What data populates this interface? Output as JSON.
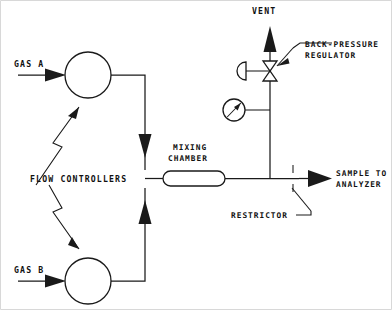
{
  "diagram": {
    "type": "process-flow-schematic",
    "ink_color": "#1a1a1a",
    "background_color": "#ffffff",
    "labels": {
      "gas_a": "GAS A",
      "gas_b": "GAS B",
      "flow_controllers": "FLOW CONTROLLERS",
      "mixing_chamber_line1": "MIXING",
      "mixing_chamber_line2": "CHAMBER",
      "vent": "VENT",
      "back_pressure_line1": "BACK-PRESSURE",
      "back_pressure_line2": "REGULATOR",
      "restrictor": "RESTRICTOR",
      "sample_line1": "SAMPLE TO",
      "sample_line2": "ANALYZER"
    },
    "components": [
      {
        "name": "flow-controller-a",
        "symbol": "circle",
        "label": "GAS A",
        "cx": 88,
        "cy": 75,
        "r": 23
      },
      {
        "name": "flow-controller-b",
        "symbol": "circle",
        "label": "GAS B",
        "cx": 88,
        "cy": 281,
        "r": 23
      },
      {
        "name": "mixing-chamber",
        "symbol": "stadium",
        "label": "MIXING CHAMBER",
        "x": 163,
        "y": 171,
        "width": 62,
        "height": 15
      },
      {
        "name": "back-pressure-regulator",
        "symbol": "bowtie-valve-with-diaphragm",
        "label": "BACK-PRESSURE REGULATOR",
        "cx": 270,
        "cy": 71
      },
      {
        "name": "pressure-gauge",
        "symbol": "circle-with-needle",
        "cx": 234,
        "cy": 110,
        "r": 11
      },
      {
        "name": "restrictor",
        "symbol": "double-tick",
        "label": "RESTRICTOR",
        "x": 293,
        "y": 178
      }
    ],
    "streams": [
      {
        "name": "gas-a-inlet",
        "from": "GAS A",
        "to": "flow-controller-a",
        "direction": "right"
      },
      {
        "name": "gas-b-inlet",
        "from": "GAS B",
        "to": "flow-controller-b",
        "direction": "right"
      },
      {
        "name": "controller-a-to-manifold",
        "direction": "down"
      },
      {
        "name": "controller-b-to-manifold",
        "direction": "up"
      },
      {
        "name": "manifold-to-mixing-chamber",
        "direction": "right"
      },
      {
        "name": "chamber-to-sample-tee",
        "direction": "right"
      },
      {
        "name": "tee-to-vent",
        "direction": "up"
      },
      {
        "name": "tee-to-analyzer",
        "direction": "right"
      }
    ]
  }
}
